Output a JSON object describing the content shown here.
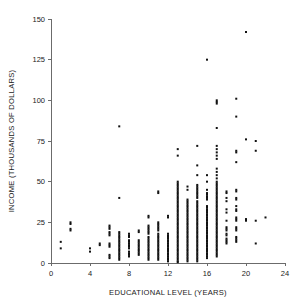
{
  "chart_data": {
    "type": "scatter",
    "title": "",
    "xlabel": "EDUCATIONAL LEVEL (YEARS)",
    "ylabel": "INCOME (THOUSANDS OF DOLLARS)",
    "xlim": [
      0,
      24
    ],
    "ylim": [
      0,
      150
    ],
    "xticks": [
      0,
      4,
      8,
      12,
      16,
      20,
      24
    ],
    "yticks": [
      0,
      25,
      50,
      75,
      100,
      125,
      150
    ],
    "xtick_labels": [
      "0",
      "4",
      "8",
      "12",
      "16",
      "20",
      "24"
    ],
    "ytick_labels": [
      "0",
      "25",
      "50",
      "75",
      "100",
      "125",
      "150"
    ],
    "grid": false,
    "legend": null,
    "marker": "square",
    "marker_size_px": 2,
    "marker_color": "#111111",
    "axis_color": "#6b6b6b",
    "points": [
      [
        1,
        13
      ],
      [
        1,
        9
      ],
      [
        2,
        25
      ],
      [
        2,
        24
      ],
      [
        2,
        21
      ],
      [
        2,
        20
      ],
      [
        4,
        9
      ],
      [
        4,
        7
      ],
      [
        5,
        12
      ],
      [
        5,
        11
      ],
      [
        6,
        23
      ],
      [
        6,
        22
      ],
      [
        6,
        21
      ],
      [
        6,
        19
      ],
      [
        6,
        18
      ],
      [
        6,
        17
      ],
      [
        6,
        12
      ],
      [
        6,
        11
      ],
      [
        6,
        10
      ],
      [
        6,
        5
      ],
      [
        6,
        4
      ],
      [
        6,
        3
      ],
      [
        7,
        84
      ],
      [
        7,
        40
      ],
      [
        7,
        19
      ],
      [
        7,
        18
      ],
      [
        7,
        17
      ],
      [
        7,
        16
      ],
      [
        7,
        15
      ],
      [
        7,
        14
      ],
      [
        7,
        13
      ],
      [
        7,
        12
      ],
      [
        7,
        11
      ],
      [
        7,
        10
      ],
      [
        7,
        9
      ],
      [
        7,
        8
      ],
      [
        7,
        7
      ],
      [
        7,
        6
      ],
      [
        7,
        5
      ],
      [
        7,
        4
      ],
      [
        7,
        3
      ],
      [
        7,
        2
      ],
      [
        8,
        18
      ],
      [
        8,
        17
      ],
      [
        8,
        16
      ],
      [
        8,
        14
      ],
      [
        8,
        13
      ],
      [
        8,
        12
      ],
      [
        8,
        11
      ],
      [
        8,
        10
      ],
      [
        8,
        9
      ],
      [
        8,
        7
      ],
      [
        8,
        6
      ],
      [
        8,
        5
      ],
      [
        8,
        4
      ],
      [
        9,
        20
      ],
      [
        9,
        19
      ],
      [
        9,
        14
      ],
      [
        9,
        13
      ],
      [
        9,
        12
      ],
      [
        9,
        11
      ],
      [
        9,
        10
      ],
      [
        9,
        9
      ],
      [
        9,
        8
      ],
      [
        9,
        7
      ],
      [
        9,
        6
      ],
      [
        9,
        5
      ],
      [
        10,
        29
      ],
      [
        10,
        28
      ],
      [
        10,
        23
      ],
      [
        10,
        22
      ],
      [
        10,
        21
      ],
      [
        10,
        20
      ],
      [
        10,
        19
      ],
      [
        10,
        18
      ],
      [
        10,
        16
      ],
      [
        10,
        15
      ],
      [
        10,
        14
      ],
      [
        10,
        13
      ],
      [
        10,
        12
      ],
      [
        10,
        11
      ],
      [
        10,
        10
      ],
      [
        10,
        9
      ],
      [
        10,
        8
      ],
      [
        10,
        7
      ],
      [
        10,
        6
      ],
      [
        10,
        5
      ],
      [
        10,
        4
      ],
      [
        10,
        3
      ],
      [
        10,
        2
      ],
      [
        11,
        44
      ],
      [
        11,
        43
      ],
      [
        11,
        25
      ],
      [
        11,
        24
      ],
      [
        11,
        23
      ],
      [
        11,
        22
      ],
      [
        11,
        21
      ],
      [
        11,
        20
      ],
      [
        11,
        18
      ],
      [
        11,
        17
      ],
      [
        11,
        16
      ],
      [
        11,
        15
      ],
      [
        11,
        14
      ],
      [
        11,
        13
      ],
      [
        11,
        12
      ],
      [
        11,
        11
      ],
      [
        11,
        10
      ],
      [
        11,
        9
      ],
      [
        11,
        8
      ],
      [
        11,
        7
      ],
      [
        11,
        6
      ],
      [
        11,
        5
      ],
      [
        11,
        4
      ],
      [
        11,
        3
      ],
      [
        11,
        2
      ],
      [
        12,
        29
      ],
      [
        12,
        28
      ],
      [
        12,
        18
      ],
      [
        12,
        17
      ],
      [
        12,
        16
      ],
      [
        12,
        15
      ],
      [
        12,
        14
      ],
      [
        12,
        13
      ],
      [
        12,
        12
      ],
      [
        12,
        11
      ],
      [
        12,
        10
      ],
      [
        12,
        9
      ],
      [
        12,
        8
      ],
      [
        12,
        7
      ],
      [
        12,
        6
      ],
      [
        12,
        5
      ],
      [
        12,
        4
      ],
      [
        12,
        3
      ],
      [
        12,
        2
      ],
      [
        12,
        1
      ],
      [
        13,
        70
      ],
      [
        13,
        66
      ],
      [
        13,
        50
      ],
      [
        13,
        49
      ],
      [
        13,
        48
      ],
      [
        13,
        47
      ],
      [
        13,
        46
      ],
      [
        13,
        45
      ],
      [
        13,
        44
      ],
      [
        13,
        43
      ],
      [
        13,
        42
      ],
      [
        13,
        41
      ],
      [
        13,
        40
      ],
      [
        13,
        39
      ],
      [
        13,
        38
      ],
      [
        13,
        37
      ],
      [
        13,
        36
      ],
      [
        13,
        35
      ],
      [
        13,
        34
      ],
      [
        13,
        33
      ],
      [
        13,
        32
      ],
      [
        13,
        31
      ],
      [
        13,
        30
      ],
      [
        13,
        29
      ],
      [
        13,
        28
      ],
      [
        13,
        27
      ],
      [
        13,
        26
      ],
      [
        13,
        25
      ],
      [
        13,
        24
      ],
      [
        13,
        23
      ],
      [
        13,
        22
      ],
      [
        13,
        21
      ],
      [
        13,
        20
      ],
      [
        13,
        19
      ],
      [
        13,
        18
      ],
      [
        13,
        17
      ],
      [
        13,
        16
      ],
      [
        13,
        15
      ],
      [
        13,
        14
      ],
      [
        13,
        13
      ],
      [
        13,
        12
      ],
      [
        13,
        11
      ],
      [
        13,
        10
      ],
      [
        13,
        9
      ],
      [
        13,
        8
      ],
      [
        13,
        7
      ],
      [
        13,
        6
      ],
      [
        13,
        5
      ],
      [
        13,
        4
      ],
      [
        13,
        3
      ],
      [
        13,
        2
      ],
      [
        13,
        1
      ],
      [
        13,
        0.5
      ],
      [
        14,
        47
      ],
      [
        14,
        45
      ],
      [
        14,
        39
      ],
      [
        14,
        38
      ],
      [
        14,
        37
      ],
      [
        14,
        36
      ],
      [
        14,
        35
      ],
      [
        14,
        34
      ],
      [
        14,
        33
      ],
      [
        14,
        32
      ],
      [
        14,
        31
      ],
      [
        14,
        30
      ],
      [
        14,
        29
      ],
      [
        14,
        28
      ],
      [
        14,
        27
      ],
      [
        14,
        26
      ],
      [
        14,
        25
      ],
      [
        14,
        24
      ],
      [
        14,
        23
      ],
      [
        14,
        22
      ],
      [
        14,
        21
      ],
      [
        14,
        20
      ],
      [
        14,
        19
      ],
      [
        14,
        18
      ],
      [
        14,
        17
      ],
      [
        14,
        16
      ],
      [
        14,
        15
      ],
      [
        14,
        14
      ],
      [
        14,
        13
      ],
      [
        14,
        12
      ],
      [
        14,
        11
      ],
      [
        14,
        10
      ],
      [
        14,
        9
      ],
      [
        14,
        8
      ],
      [
        14,
        7
      ],
      [
        14,
        6
      ],
      [
        14,
        5
      ],
      [
        14,
        4
      ],
      [
        14,
        3
      ],
      [
        14,
        2
      ],
      [
        14,
        1
      ],
      [
        15,
        72
      ],
      [
        15,
        60
      ],
      [
        15,
        54
      ],
      [
        15,
        48
      ],
      [
        15,
        47
      ],
      [
        15,
        46
      ],
      [
        15,
        45
      ],
      [
        15,
        44
      ],
      [
        15,
        43
      ],
      [
        15,
        42
      ],
      [
        15,
        41
      ],
      [
        15,
        40
      ],
      [
        15,
        38
      ],
      [
        15,
        37
      ],
      [
        15,
        36
      ],
      [
        15,
        35
      ],
      [
        15,
        34
      ],
      [
        15,
        33
      ],
      [
        15,
        32
      ],
      [
        15,
        31
      ],
      [
        15,
        30
      ],
      [
        15,
        29
      ],
      [
        15,
        28
      ],
      [
        15,
        27
      ],
      [
        15,
        26
      ],
      [
        15,
        25
      ],
      [
        15,
        24
      ],
      [
        15,
        23
      ],
      [
        15,
        22
      ],
      [
        15,
        21
      ],
      [
        15,
        20
      ],
      [
        15,
        19
      ],
      [
        15,
        18
      ],
      [
        15,
        17
      ],
      [
        15,
        16
      ],
      [
        15,
        15
      ],
      [
        15,
        14
      ],
      [
        15,
        13
      ],
      [
        15,
        12
      ],
      [
        15,
        11
      ],
      [
        15,
        10
      ],
      [
        15,
        9
      ],
      [
        15,
        8
      ],
      [
        15,
        7
      ],
      [
        15,
        6
      ],
      [
        15,
        5
      ],
      [
        15,
        4
      ],
      [
        15,
        3
      ],
      [
        15,
        2
      ],
      [
        15,
        1
      ],
      [
        16,
        125
      ],
      [
        16,
        54
      ],
      [
        16,
        50
      ],
      [
        16,
        45
      ],
      [
        16,
        43
      ],
      [
        16,
        42
      ],
      [
        16,
        41
      ],
      [
        16,
        40
      ],
      [
        16,
        39
      ],
      [
        16,
        35
      ],
      [
        16,
        34
      ],
      [
        16,
        33
      ],
      [
        16,
        32
      ],
      [
        16,
        31
      ],
      [
        16,
        30
      ],
      [
        16,
        29
      ],
      [
        16,
        28
      ],
      [
        16,
        27
      ],
      [
        16,
        26
      ],
      [
        16,
        25
      ],
      [
        16,
        24
      ],
      [
        16,
        23
      ],
      [
        16,
        22
      ],
      [
        16,
        21
      ],
      [
        16,
        20
      ],
      [
        16,
        19
      ],
      [
        16,
        18
      ],
      [
        16,
        17
      ],
      [
        16,
        16
      ],
      [
        16,
        15
      ],
      [
        16,
        14
      ],
      [
        16,
        13
      ],
      [
        16,
        12
      ],
      [
        16,
        11
      ],
      [
        16,
        10
      ],
      [
        16,
        9
      ],
      [
        16,
        8
      ],
      [
        16,
        7
      ],
      [
        16,
        6
      ],
      [
        16,
        5
      ],
      [
        16,
        4
      ],
      [
        16,
        3
      ],
      [
        17,
        100
      ],
      [
        17,
        99
      ],
      [
        17,
        98
      ],
      [
        17,
        83
      ],
      [
        17,
        72
      ],
      [
        17,
        70
      ],
      [
        17,
        68
      ],
      [
        17,
        66
      ],
      [
        17,
        64
      ],
      [
        17,
        58
      ],
      [
        17,
        56
      ],
      [
        17,
        54
      ],
      [
        17,
        52
      ],
      [
        17,
        50
      ],
      [
        17,
        49
      ],
      [
        17,
        48
      ],
      [
        17,
        47
      ],
      [
        17,
        46
      ],
      [
        17,
        45
      ],
      [
        17,
        44
      ],
      [
        17,
        43
      ],
      [
        17,
        42
      ],
      [
        17,
        41
      ],
      [
        17,
        40
      ],
      [
        17,
        39
      ],
      [
        17,
        38
      ],
      [
        17,
        37
      ],
      [
        17,
        36
      ],
      [
        17,
        35
      ],
      [
        17,
        34
      ],
      [
        17,
        33
      ],
      [
        17,
        32
      ],
      [
        17,
        31
      ],
      [
        17,
        30
      ],
      [
        17,
        29
      ],
      [
        17,
        28
      ],
      [
        17,
        27
      ],
      [
        17,
        26
      ],
      [
        17,
        25
      ],
      [
        17,
        24
      ],
      [
        17,
        23
      ],
      [
        17,
        22
      ],
      [
        17,
        21
      ],
      [
        17,
        20
      ],
      [
        17,
        19
      ],
      [
        17,
        18
      ],
      [
        17,
        17
      ],
      [
        17,
        16
      ],
      [
        17,
        15
      ],
      [
        17,
        14
      ],
      [
        17,
        13
      ],
      [
        17,
        12
      ],
      [
        17,
        11
      ],
      [
        17,
        10
      ],
      [
        17,
        9
      ],
      [
        17,
        8
      ],
      [
        17,
        7
      ],
      [
        17,
        6
      ],
      [
        17,
        5
      ],
      [
        17,
        4
      ],
      [
        18,
        44
      ],
      [
        18,
        43
      ],
      [
        18,
        40
      ],
      [
        18,
        38
      ],
      [
        18,
        33
      ],
      [
        18,
        31
      ],
      [
        18,
        26
      ],
      [
        18,
        22
      ],
      [
        18,
        21
      ],
      [
        18,
        20
      ],
      [
        18,
        18
      ],
      [
        18,
        17
      ],
      [
        18,
        15
      ],
      [
        18,
        14
      ],
      [
        18,
        13
      ],
      [
        18,
        12
      ],
      [
        19,
        101
      ],
      [
        19,
        90
      ],
      [
        19,
        69
      ],
      [
        19,
        68
      ],
      [
        19,
        62
      ],
      [
        19,
        45
      ],
      [
        19,
        44
      ],
      [
        19,
        40
      ],
      [
        19,
        39
      ],
      [
        19,
        35
      ],
      [
        19,
        33
      ],
      [
        19,
        32
      ],
      [
        19,
        28
      ],
      [
        19,
        27
      ],
      [
        19,
        26
      ],
      [
        19,
        22
      ],
      [
        19,
        21
      ],
      [
        19,
        20
      ],
      [
        19,
        16
      ],
      [
        19,
        15
      ],
      [
        19,
        14
      ],
      [
        19,
        13
      ],
      [
        20,
        142
      ],
      [
        20,
        76
      ],
      [
        20,
        27
      ],
      [
        20,
        26
      ],
      [
        21,
        75
      ],
      [
        21,
        69
      ],
      [
        21,
        26
      ],
      [
        21,
        12
      ],
      [
        22,
        28
      ]
    ]
  },
  "layout": {
    "plot_left_px": 51,
    "plot_right_px": 285,
    "plot_top_px": 19,
    "plot_bottom_px": 263
  }
}
